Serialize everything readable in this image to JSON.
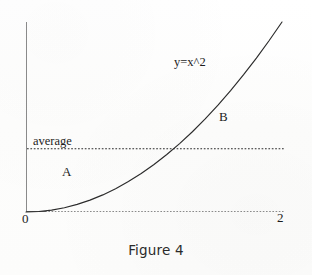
{
  "figure": {
    "caption": "Figure 4",
    "background_color": "#fefefe",
    "ink_color": "#1c1c1c"
  },
  "labels": {
    "curve_equation": "y=x^2",
    "average_line": "average",
    "region_below": "A",
    "region_above": "B",
    "x_origin": "0",
    "x_max": "2"
  },
  "chart_data": {
    "type": "line",
    "title": "Figure 4",
    "xlabel": "",
    "ylabel": "",
    "xlim": [
      0,
      2
    ],
    "ylim": [
      0,
      4
    ],
    "grid": false,
    "legend": "none",
    "xticks": [
      0,
      2
    ],
    "xticklabels": [
      "0",
      "2"
    ],
    "yticks": [],
    "yticklabels": [],
    "series": [
      {
        "name": "y=x^2",
        "style": "solid",
        "color": "#1c1c1c",
        "annotation": "y=x^2",
        "x": [
          0,
          0.1,
          0.2,
          0.3,
          0.4,
          0.5,
          0.6,
          0.7,
          0.8,
          0.9,
          1.0,
          1.1,
          1.2,
          1.3,
          1.4,
          1.5,
          1.6,
          1.7,
          1.8,
          1.9,
          2.0
        ],
        "y": [
          0,
          0.01,
          0.04,
          0.09,
          0.16,
          0.25,
          0.36,
          0.49,
          0.64,
          0.81,
          1.0,
          1.21,
          1.44,
          1.69,
          1.96,
          2.25,
          2.56,
          2.89,
          3.24,
          3.61,
          4.0
        ]
      },
      {
        "name": "average",
        "style": "dotted",
        "color": "#2a2a2a",
        "annotation": "average",
        "type": "horizontal-line",
        "y_value": 1.3333,
        "x": [
          0,
          2
        ],
        "y": [
          1.3333,
          1.3333
        ]
      }
    ],
    "annotations": [
      {
        "text": "y=x^2",
        "x": 1.16,
        "y": 3.1
      },
      {
        "text": "average",
        "x": 0.06,
        "y": 1.55
      },
      {
        "text": "A",
        "x": 0.28,
        "y": 0.92
      },
      {
        "text": "B",
        "x": 1.51,
        "y": 2.05
      }
    ],
    "intersection": {
      "x": 1.1547,
      "y": 1.3333
    }
  }
}
